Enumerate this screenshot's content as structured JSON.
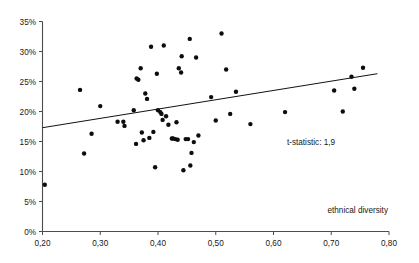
{
  "chart_data": {
    "type": "scatter",
    "title": "",
    "subtitle": "",
    "xlabel": "ethnical diversity",
    "ylabel": "",
    "xlim": [
      0.2,
      0.8
    ],
    "ylim": [
      0,
      35
    ],
    "grid": false,
    "legend": null,
    "y_unit": "percent",
    "x_tick_labels": [
      "0,20",
      "0,30",
      "0,40",
      "0,50",
      "0,60",
      "0,70",
      "0,80"
    ],
    "x_tick_values": [
      0.2,
      0.3,
      0.4,
      0.5,
      0.6,
      0.7,
      0.8
    ],
    "y_tick_labels": [
      "0%",
      "5%",
      "10%",
      "15%",
      "20%",
      "25%",
      "30%",
      "35%"
    ],
    "y_tick_values": [
      0,
      5,
      10,
      15,
      20,
      25,
      30,
      35
    ],
    "annotations": [
      {
        "text": "t-statistic: 1,9",
        "x": 0.665,
        "y": 14.5
      }
    ],
    "series": [
      {
        "name": "observations",
        "marker": "circle",
        "color": "#0d0d0d",
        "points": [
          [
            0.204,
            7.8
          ],
          [
            0.265,
            23.6
          ],
          [
            0.272,
            13.0
          ],
          [
            0.285,
            16.3
          ],
          [
            0.3,
            20.9
          ],
          [
            0.33,
            18.3
          ],
          [
            0.34,
            18.3
          ],
          [
            0.342,
            17.6
          ],
          [
            0.358,
            20.2
          ],
          [
            0.362,
            14.6
          ],
          [
            0.363,
            25.5
          ],
          [
            0.366,
            25.3
          ],
          [
            0.37,
            27.2
          ],
          [
            0.372,
            16.5
          ],
          [
            0.375,
            15.2
          ],
          [
            0.378,
            23.0
          ],
          [
            0.381,
            22.1
          ],
          [
            0.385,
            15.6
          ],
          [
            0.388,
            30.8
          ],
          [
            0.392,
            16.6
          ],
          [
            0.395,
            10.7
          ],
          [
            0.398,
            26.3
          ],
          [
            0.4,
            20.2
          ],
          [
            0.404,
            19.9
          ],
          [
            0.406,
            19.6
          ],
          [
            0.408,
            18.6
          ],
          [
            0.41,
            31.0
          ],
          [
            0.414,
            19.2
          ],
          [
            0.418,
            17.8
          ],
          [
            0.424,
            15.5
          ],
          [
            0.426,
            15.5
          ],
          [
            0.43,
            15.4
          ],
          [
            0.432,
            18.2
          ],
          [
            0.434,
            15.3
          ],
          [
            0.436,
            27.2
          ],
          [
            0.44,
            26.5
          ],
          [
            0.441,
            29.2
          ],
          [
            0.444,
            10.2
          ],
          [
            0.448,
            15.4
          ],
          [
            0.452,
            15.4
          ],
          [
            0.455,
            32.1
          ],
          [
            0.456,
            11.0
          ],
          [
            0.458,
            13.1
          ],
          [
            0.462,
            14.9
          ],
          [
            0.466,
            29.0
          ],
          [
            0.47,
            16.0
          ],
          [
            0.492,
            22.4
          ],
          [
            0.5,
            18.5
          ],
          [
            0.51,
            33.0
          ],
          [
            0.518,
            27.0
          ],
          [
            0.525,
            19.6
          ],
          [
            0.535,
            23.3
          ],
          [
            0.56,
            17.9
          ],
          [
            0.62,
            19.9
          ],
          [
            0.705,
            23.5
          ],
          [
            0.72,
            20.0
          ],
          [
            0.735,
            25.8
          ],
          [
            0.74,
            23.8
          ],
          [
            0.755,
            27.3
          ]
        ]
      }
    ],
    "trend_line": {
      "name": "regression line",
      "color": "#121212",
      "x_start": 0.2,
      "y_start": 17.3,
      "x_end": 0.78,
      "y_end": 26.3
    }
  }
}
